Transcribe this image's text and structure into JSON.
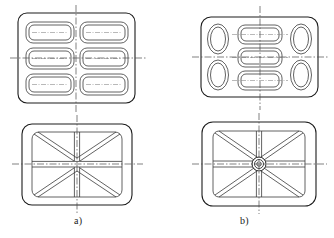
{
  "figure": {
    "type": "engineering-drawing",
    "canvas": {
      "width": 334,
      "height": 238,
      "background": "#ffffff"
    },
    "style": {
      "outline_color": "#1c1c1c",
      "inner_color": "#3a3a3a",
      "centerline_color": "#4a4a4a",
      "outline_width": 1.1,
      "inner_width": 0.8,
      "centerline_width": 0.7,
      "centerline_dash": "7,2,1.5,2"
    },
    "variants": [
      {
        "id": "a",
        "label": "a)",
        "label_x": 74,
        "label_y": 215,
        "top_view": {
          "name": "six-pocket-plate-top-view",
          "outer_rect": {
            "x": 18,
            "y": 13,
            "w": 117,
            "h": 90,
            "r": 9
          },
          "pocket_layout": {
            "columns": 2,
            "rows": 3,
            "shape": "rounded-rectangle"
          },
          "pockets": [
            {
              "x": 26,
              "y": 22,
              "w": 48,
              "h": 21,
              "r": 7
            },
            {
              "x": 80,
              "y": 22,
              "w": 48,
              "h": 21,
              "r": 7
            },
            {
              "x": 26,
              "y": 48,
              "w": 48,
              "h": 21,
              "r": 7
            },
            {
              "x": 80,
              "y": 48,
              "w": 48,
              "h": 21,
              "r": 7
            },
            {
              "x": 26,
              "y": 74,
              "w": 48,
              "h": 21,
              "r": 7
            },
            {
              "x": 80,
              "y": 74,
              "w": 48,
              "h": 21,
              "r": 7
            }
          ],
          "wall_offset": 3,
          "centerlines": {
            "vertical": {
              "x": 76,
              "y1": 5,
              "y2": 112
            },
            "horizontal": {
              "y": 58,
              "x1": 10,
              "x2": 147
            },
            "pocket_axes_y": [
              32.5,
              58.5,
              84.5
            ],
            "pocket_axes_x": [
              [
                30,
                70
              ],
              [
                84,
                124
              ]
            ]
          }
        },
        "bottom_view": {
          "name": "x-rib-plate-bottom-view",
          "outer_rect": {
            "x": 22,
            "y": 124,
            "w": 110,
            "h": 81,
            "r": 10
          },
          "inner_rect": {
            "x": 32,
            "y": 132,
            "w": 90,
            "h": 65,
            "r": 7
          },
          "rib_center": {
            "x": 77,
            "y": 164
          },
          "rib_half_width": 2.6,
          "rib_directions": [
            "diagonal-up-left",
            "diagonal-up-right",
            "diagonal-down-left",
            "diagonal-down-right",
            "left",
            "right",
            "up",
            "down"
          ],
          "hub": null,
          "centerlines": {
            "vertical": {
              "x": 77,
              "y1": 115,
              "y2": 214
            },
            "horizontal": {
              "y": 164,
              "x1": 12,
              "x2": 143
            }
          }
        }
      },
      {
        "id": "b",
        "label": "b)",
        "label_x": 240,
        "label_y": 215,
        "top_view": {
          "name": "oval-and-slot-plate-top-view",
          "outer_rect": {
            "x": 201,
            "y": 17,
            "w": 117,
            "h": 80,
            "r": 10
          },
          "side_ovals": [
            {
              "cx": 218,
              "cy": 39,
              "rx": 10.5,
              "ry": 15
            },
            {
              "cx": 218,
              "cy": 75,
              "rx": 10.5,
              "ry": 15
            },
            {
              "cx": 301,
              "cy": 39,
              "rx": 10.5,
              "ry": 15
            },
            {
              "cx": 301,
              "cy": 75,
              "rx": 10.5,
              "ry": 15
            }
          ],
          "center_slots": [
            {
              "x": 238,
              "y": 25,
              "w": 44,
              "h": 19,
              "r": 7
            },
            {
              "x": 238,
              "y": 48,
              "w": 44,
              "h": 19,
              "r": 7
            },
            {
              "x": 238,
              "y": 71,
              "w": 44,
              "h": 19,
              "r": 7
            }
          ],
          "wall_offset": 3,
          "centerlines": {
            "vertical": {
              "x": 260,
              "y1": 6,
              "y2": 110
            },
            "horizontal": {
              "y": 57,
              "x1": 192,
              "x2": 328
            },
            "slot_axes_y": [
              34.5,
              57.5,
              80.5
            ]
          }
        },
        "bottom_view": {
          "name": "hub-rib-plate-bottom-view",
          "outer_rect": {
            "x": 202,
            "y": 122,
            "w": 114,
            "h": 84,
            "r": 11
          },
          "inner_rect": {
            "x": 213,
            "y": 131,
            "w": 92,
            "h": 66,
            "r": 6
          },
          "rib_center": {
            "x": 259,
            "y": 164
          },
          "rib_half_width": 2.6,
          "rib_directions": [
            "diagonal-up-left",
            "diagonal-up-right",
            "diagonal-down-left",
            "diagonal-down-right",
            "left",
            "right",
            "up",
            "down"
          ],
          "hub": {
            "cx": 259,
            "cy": 164,
            "r_outer": 7,
            "r_mid": 4.5,
            "r_inner": 2.2
          },
          "centerlines": {
            "vertical": {
              "x": 259,
              "y1": 113,
              "y2": 214
            },
            "horizontal": {
              "y": 164,
              "x1": 192,
              "x2": 327
            }
          }
        }
      }
    ]
  }
}
